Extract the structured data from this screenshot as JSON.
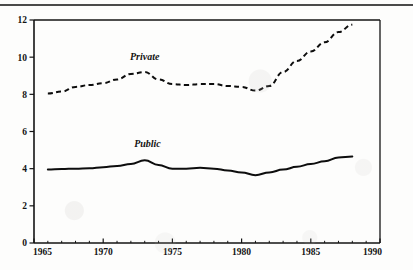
{
  "figure": {
    "background_color": "#fdfdfc",
    "ink_color": "#0d0d0d",
    "top_rule": "page-rule"
  },
  "chart_data": {
    "type": "line",
    "title": "",
    "subtitle": "",
    "xlabel": "",
    "ylabel": "",
    "xlim": [
      1965,
      1990
    ],
    "ylim": [
      0,
      12
    ],
    "grid": false,
    "legend": "inline-annotations",
    "x_ticks": [
      1965,
      1970,
      1975,
      1980,
      1985,
      1990
    ],
    "x_tick_labels": [
      "1965",
      "1970",
      "1975",
      "1980",
      "1985",
      "1990"
    ],
    "x_minor_tick_interval": 1,
    "y_ticks": [
      0,
      2,
      4,
      6,
      8,
      10,
      12
    ],
    "y_tick_labels": [
      "0",
      "2",
      "4",
      "6",
      "8",
      "10",
      "12"
    ],
    "series": [
      {
        "name": "Private",
        "style": "dashed",
        "label_text": "Private",
        "label_x": 1973.0,
        "label_y": 9.85,
        "x": [
          1966,
          1967,
          1968,
          1969,
          1970,
          1971,
          1972,
          1973,
          1974,
          1975,
          1976,
          1977,
          1978,
          1979,
          1980,
          1981,
          1982,
          1983,
          1984,
          1985,
          1986,
          1987,
          1988
        ],
        "values": [
          8.05,
          8.15,
          8.4,
          8.5,
          8.6,
          8.8,
          9.1,
          9.2,
          8.8,
          8.55,
          8.5,
          8.55,
          8.55,
          8.45,
          8.4,
          8.2,
          8.45,
          9.2,
          9.8,
          10.3,
          10.8,
          11.35,
          11.75
        ]
      },
      {
        "name": "Public",
        "style": "solid",
        "label_text": "Public",
        "label_x": 1973.2,
        "label_y": 5.15,
        "x": [
          1966,
          1967,
          1968,
          1969,
          1970,
          1971,
          1972,
          1973,
          1974,
          1975,
          1976,
          1977,
          1978,
          1979,
          1980,
          1981,
          1982,
          1983,
          1984,
          1985,
          1986,
          1987,
          1988
        ],
        "values": [
          3.95,
          3.98,
          4.0,
          4.02,
          4.08,
          4.15,
          4.25,
          4.45,
          4.2,
          4.0,
          4.0,
          4.05,
          4.0,
          3.9,
          3.8,
          3.65,
          3.8,
          3.95,
          4.1,
          4.25,
          4.4,
          4.6,
          4.65
        ]
      }
    ]
  }
}
